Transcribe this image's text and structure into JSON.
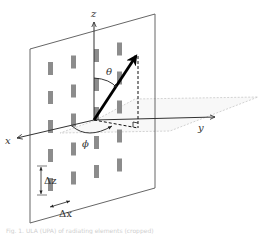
{
  "diagram": {
    "axes": {
      "x_label": "x",
      "y_label": "y",
      "z_label": "z"
    },
    "angles": {
      "theta_label": "θ",
      "phi_label": "ϕ"
    },
    "spacing": {
      "dz_label": "Δz",
      "dx_label": "Δx"
    },
    "array": {
      "rows": 5,
      "columns": 4,
      "element_color": "#8c8c8c"
    },
    "colors": {
      "panel_outline": "#555555",
      "axis": "#333333",
      "vector": "#000000",
      "plane_dashed": "#bdbdbd"
    },
    "caption_text": "Fig. 1. ULA (UPA) of radiating elements (cropped)"
  }
}
